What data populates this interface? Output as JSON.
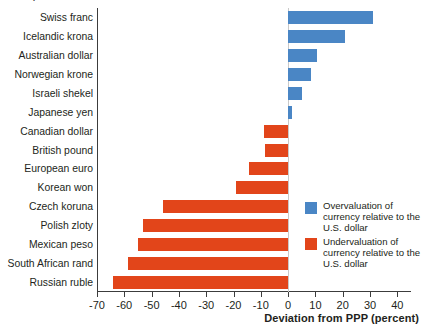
{
  "caption_remnant": "2003)",
  "axis": {
    "x_title": "Deviation from PPP (percent)",
    "x_ticks": [
      "-70",
      "-60",
      "-50",
      "-40",
      "-30",
      "-20",
      "-10",
      "0",
      "10",
      "20",
      "30",
      "40"
    ]
  },
  "legend": {
    "items": [
      {
        "swatch": "blue",
        "color": "#4a86c5",
        "label": "Overvaluation of currency relative to the U.S. dollar"
      },
      {
        "swatch": "red",
        "color": "#e2451a",
        "label": "Undervaluation of currency relative to the U.S. dollar"
      }
    ]
  },
  "colors": {
    "overvalued": "#4a86c5",
    "undervalued": "#e2451a",
    "axis": "#3c3c3c",
    "text": "#231f20"
  },
  "chart_data": {
    "type": "bar",
    "orientation": "horizontal",
    "title": "",
    "xlabel": "Deviation from PPP (percent)",
    "ylabel": "",
    "xlim": [
      -70,
      45
    ],
    "xticks": [
      -70,
      -60,
      -50,
      -40,
      -30,
      -20,
      -10,
      0,
      10,
      20,
      30,
      40
    ],
    "grid": false,
    "legend_position": "inside-right",
    "categories": [
      "Swiss franc",
      "Icelandic krona",
      "Australian dollar",
      "Norwegian krone",
      "Israeli shekel",
      "Japanese yen",
      "Canadian dollar",
      "British pound",
      "European euro",
      "Korean won",
      "Czech koruna",
      "Polish zloty",
      "Mexican peso",
      "South African rand",
      "Russian ruble"
    ],
    "values": [
      31,
      21,
      10.5,
      8.5,
      5,
      1.5,
      -9,
      -8.5,
      -14.5,
      -19,
      -46,
      -53,
      -55,
      -58.5,
      -64
    ],
    "series": [
      {
        "name": "Deviation from PPP (percent)",
        "values": [
          31,
          21,
          10.5,
          8.5,
          5,
          1.5,
          -9,
          -8.5,
          -14.5,
          -19,
          -46,
          -53,
          -55,
          -58.5,
          -64
        ]
      }
    ]
  }
}
